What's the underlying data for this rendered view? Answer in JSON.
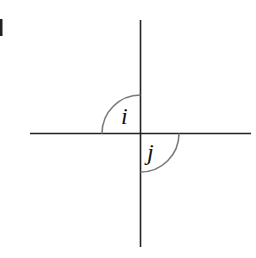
{
  "diagram": {
    "title": "",
    "angles": [
      {
        "label": "i",
        "quadrant": "upper-left"
      },
      {
        "label": "j",
        "quadrant": "lower-right"
      }
    ],
    "edge_fragment": "j",
    "colors": {
      "line": "#222222",
      "arc": "#7a7a7a",
      "text": "#111111"
    }
  }
}
